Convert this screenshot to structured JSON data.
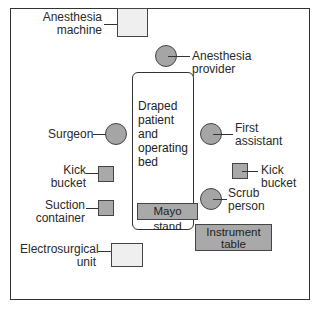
{
  "diagram": {
    "type": "operating-room-layout",
    "labels": {
      "anesthesia_machine": "Anesthesia machine",
      "anesthesia_machine_l1": "Anesthesia",
      "anesthesia_machine_l2": "machine",
      "anesthesia_provider_l1": "Anesthesia",
      "anesthesia_provider_l2": "provider",
      "bed_l1": "Draped",
      "bed_l2": "patient",
      "bed_l3": "and",
      "bed_l4": "operating",
      "bed_l5": "bed",
      "surgeon": "Surgeon",
      "first_assistant_l1": "First",
      "first_assistant_l2": "assistant",
      "kick_bucket_left_l1": "Kick",
      "kick_bucket_left_l2": "bucket",
      "kick_bucket_right_l1": "Kick",
      "kick_bucket_right_l2": "bucket",
      "suction_l1": "Suction",
      "suction_l2": "container",
      "scrub_l1": "Scrub",
      "scrub_l2": "person",
      "mayo_stand": "Mayo stand",
      "instrument_table_l1": "Instrument",
      "instrument_table_l2": "table",
      "electrosurgical_l1": "Electrosurgical",
      "electrosurgical_l2": "unit"
    },
    "legend_semantics": {
      "circle": "person",
      "light-square": "equipment",
      "dark-square": "container / sterile surface"
    },
    "colors": {
      "person_fill": "#a5a5a5",
      "light_equipment_fill": "#efefef",
      "dark_equipment_fill": "#a9a9a9",
      "outline": "#333333"
    }
  }
}
